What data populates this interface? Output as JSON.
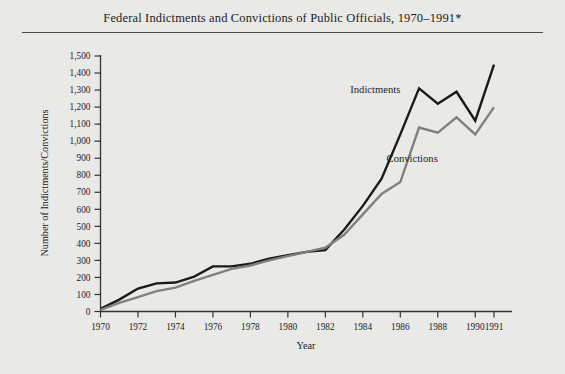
{
  "figure": {
    "title": "Federal Indictments and Convictions of Public Officials, 1970–1991*",
    "background_color": "#e9e9e7",
    "rule_color": "#4a4a4a"
  },
  "chart_data": {
    "type": "line",
    "title": "Federal Indictments and Convictions of Public Officials, 1970–1991*",
    "xlabel": "Year",
    "ylabel": "Number of Indictments/Convictions",
    "x": [
      1970,
      1971,
      1972,
      1973,
      1974,
      1975,
      1976,
      1977,
      1978,
      1979,
      1980,
      1981,
      1982,
      1983,
      1984,
      1985,
      1986,
      1987,
      1988,
      1989,
      1990,
      1991
    ],
    "xlim": [
      1970,
      1991
    ],
    "ylim": [
      0,
      1500
    ],
    "ytick_step": 100,
    "xtick_labels": [
      "1970",
      "1972",
      "1974",
      "1976",
      "1978",
      "1980",
      "1982",
      "1984",
      "1986",
      "1988",
      "1990",
      "1991"
    ],
    "xtick_values": [
      1970,
      1972,
      1974,
      1976,
      1978,
      1980,
      1982,
      1984,
      1986,
      1988,
      1990,
      1991
    ],
    "ytick_labels": [
      "0",
      "100",
      "200",
      "300",
      "400",
      "500",
      "600",
      "700",
      "800",
      "900",
      "1,000",
      "1,100",
      "1,200",
      "1,300",
      "1,400",
      "1,500"
    ],
    "ytick_values": [
      0,
      100,
      200,
      300,
      400,
      500,
      600,
      700,
      800,
      900,
      1000,
      1100,
      1200,
      1300,
      1400,
      1500
    ],
    "grid": false,
    "legend": "inline-annotations",
    "series": [
      {
        "name": "Indictments",
        "color": "#1a1a1a",
        "line_width": 2.4,
        "label_position": {
          "x": 1986.0,
          "y": 1280
        },
        "values": [
          15,
          70,
          135,
          165,
          170,
          205,
          265,
          265,
          280,
          310,
          330,
          350,
          360,
          480,
          620,
          780,
          1040,
          1310,
          1220,
          1290,
          1120,
          1450
        ]
      },
      {
        "name": "Convictions",
        "color": "#808080",
        "line_width": 2.4,
        "label_position": {
          "x": 1988.0,
          "y": 880
        },
        "values": [
          10,
          50,
          85,
          120,
          140,
          180,
          215,
          250,
          270,
          300,
          325,
          350,
          375,
          450,
          570,
          690,
          760,
          1080,
          1050,
          1140,
          1040,
          1200
        ]
      }
    ]
  }
}
